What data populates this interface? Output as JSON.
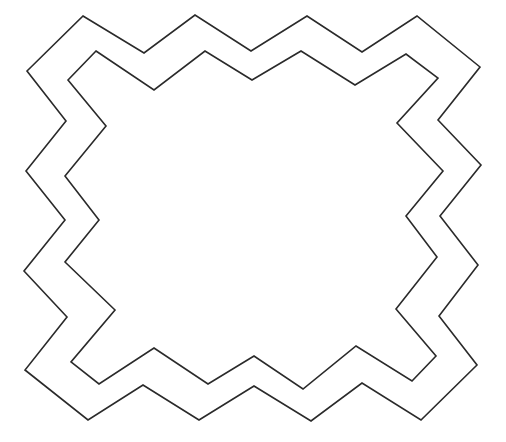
{
  "figure": {
    "background": "#ffffff",
    "stroke_color": "#2a2a2a",
    "stroke_width": 1.6,
    "outer_border": {
      "points": "83,16 144,53 195,15 251,51 307,16 362,52 417,16 480,67 438,120 481,165 440,216 478,265 439,316 477,365 421,420 362,383 311,421 254,386 199,420 143,385 88,420 25,370 67,317 24,271 65,220 26,171 66,121 27,71"
    },
    "inner_border": {
      "points": "96,51 154,90 205,51 252,80 301,51 355,85 406,54 438,78 397,123 443,171 406,216 437,257 396,309 436,356 412,381 356,346 303,389 254,356 208,384 154,348 99,384 71,362 115,310 65,262 99,220 65,176 106,126 68,80"
    }
  }
}
